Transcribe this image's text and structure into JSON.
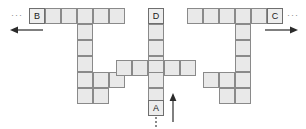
{
  "figure": {
    "type": "grid-puzzle-diagram",
    "background_color": "#ffffff",
    "cell_fill_color": "#e9e9e9",
    "cell_border_color": "#8a8a8a",
    "label_text_color": "#1a1a1a",
    "arrow_color": "#2b2b2b",
    "dots_color": "#8a8a8a",
    "cell_size_px": 16
  },
  "labels": {
    "a": "A",
    "b": "B",
    "c": "C",
    "d": "D"
  },
  "ellipsis": {
    "left": "···",
    "right": "···"
  },
  "shapes": [
    {
      "id": "left-shape",
      "name": "left-t-shape",
      "label_cell": "B",
      "origin": {
        "x": 29,
        "y": 8
      },
      "cells": [
        {
          "col": 0,
          "row": 0,
          "label": "B"
        },
        {
          "col": 1,
          "row": 0,
          "label": ""
        },
        {
          "col": 2,
          "row": 0,
          "label": ""
        },
        {
          "col": 3,
          "row": 0,
          "label": ""
        },
        {
          "col": 4,
          "row": 0,
          "label": ""
        },
        {
          "col": 5,
          "row": 0,
          "label": ""
        },
        {
          "col": 3,
          "row": 1,
          "label": ""
        },
        {
          "col": 3,
          "row": 2,
          "label": ""
        },
        {
          "col": 3,
          "row": 3,
          "label": ""
        },
        {
          "col": 3,
          "row": 4,
          "label": ""
        },
        {
          "col": 4,
          "row": 4,
          "label": ""
        },
        {
          "col": 5,
          "row": 4,
          "label": ""
        },
        {
          "col": 3,
          "row": 5,
          "label": ""
        },
        {
          "col": 4,
          "row": 5,
          "label": ""
        }
      ]
    },
    {
      "id": "middle-shape",
      "name": "middle-cross-shape",
      "label_cell_top": "D",
      "label_cell_bottom": "A",
      "origin": {
        "x": 148,
        "y": 8
      },
      "cells": [
        {
          "col": 0,
          "row": 0,
          "label": "D"
        },
        {
          "col": 0,
          "row": 1,
          "label": ""
        },
        {
          "col": 0,
          "row": 2,
          "label": ""
        },
        {
          "col": 0,
          "row": 3,
          "label": ""
        },
        {
          "col": -2,
          "row": 3,
          "label": ""
        },
        {
          "col": -1,
          "row": 3,
          "label": ""
        },
        {
          "col": 1,
          "row": 3,
          "label": ""
        },
        {
          "col": 2,
          "row": 3,
          "label": ""
        },
        {
          "col": 0,
          "row": 4,
          "label": ""
        },
        {
          "col": 0,
          "row": 5,
          "label": ""
        },
        {
          "col": 0,
          "row": 6,
          "label": "A"
        }
      ]
    },
    {
      "id": "right-shape",
      "name": "right-t-shape",
      "label_cell": "C",
      "origin": {
        "x": 187,
        "y": 8
      },
      "cells": [
        {
          "col": 0,
          "row": 0,
          "label": ""
        },
        {
          "col": 1,
          "row": 0,
          "label": ""
        },
        {
          "col": 2,
          "row": 0,
          "label": ""
        },
        {
          "col": 3,
          "row": 0,
          "label": ""
        },
        {
          "col": 4,
          "row": 0,
          "label": ""
        },
        {
          "col": 5,
          "row": 0,
          "label": ""
        },
        {
          "col": 6,
          "row": 0,
          "label": "C"
        },
        {
          "col": 3,
          "row": 1,
          "label": ""
        },
        {
          "col": 3,
          "row": 2,
          "label": ""
        },
        {
          "col": 3,
          "row": 3,
          "label": ""
        },
        {
          "col": 1,
          "row": 4,
          "label": ""
        },
        {
          "col": 2,
          "row": 4,
          "label": ""
        },
        {
          "col": 3,
          "row": 4,
          "label": ""
        },
        {
          "col": 2,
          "row": 5,
          "label": ""
        },
        {
          "col": 3,
          "row": 5,
          "label": ""
        }
      ]
    }
  ],
  "arrows": [
    {
      "id": "left-arrow",
      "name": "left-pointing-arrow",
      "direction": "left",
      "x": 10,
      "y": 30,
      "length": 30
    },
    {
      "id": "right-arrow",
      "name": "right-pointing-arrow",
      "direction": "right",
      "x": 266,
      "y": 30,
      "length": 30
    },
    {
      "id": "up-arrow",
      "name": "up-pointing-arrow",
      "direction": "up",
      "x": 173,
      "y": 95,
      "length": 28
    }
  ],
  "dotted_lines": [
    {
      "id": "left-dots",
      "name": "left-dotted-continuation",
      "orientation": "horizontal",
      "x": 11,
      "y": 10
    },
    {
      "id": "right-dots",
      "name": "right-dotted-continuation",
      "orientation": "horizontal",
      "x": 287,
      "y": 10
    },
    {
      "id": "bottom-dots",
      "name": "bottom-dotted-continuation",
      "orientation": "vertical",
      "x": 155,
      "y": 117,
      "length": 11
    }
  ]
}
